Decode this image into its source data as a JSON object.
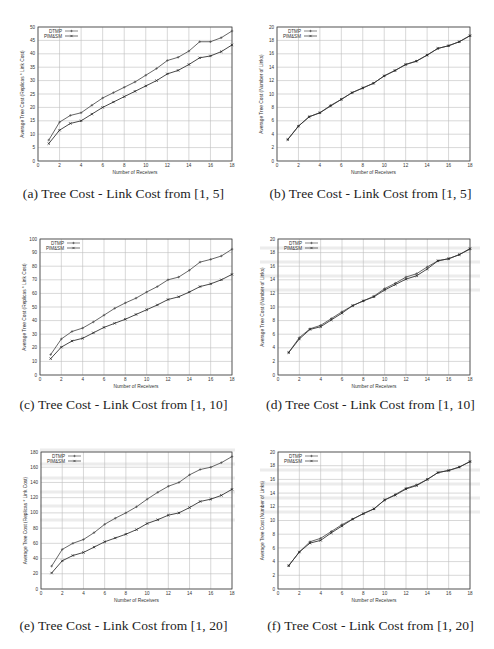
{
  "figure": {
    "captions": {
      "a": "(a) Tree Cost - Link Cost from [1, 5]",
      "b": "(b) Tree Cost - Link Cost from [1, 5]",
      "c": "(c) Tree Cost - Link Cost from [1, 10]",
      "d": "(d) Tree Cost - Link Cost from [1, 10]",
      "e": "(e) Tree Cost - Link Cost from [1, 20]",
      "f": "(f) Tree Cost - Link Cost from [1, 20]"
    }
  },
  "chart_data": [
    {
      "id": "a",
      "type": "line",
      "title": "(a) Tree Cost - Link Cost from [1, 5]",
      "xlabel": "Number of Receivers",
      "ylabel": "Average Tree Cost (Replicas * Link Cost)",
      "xlim": [
        0,
        18
      ],
      "ylim": [
        0,
        50
      ],
      "xticks": [
        0,
        2,
        4,
        6,
        8,
        10,
        12,
        14,
        16,
        18
      ],
      "yticks": [
        0,
        5,
        10,
        15,
        20,
        25,
        30,
        35,
        40,
        45,
        50
      ],
      "grid": true,
      "legend_position": "top-left",
      "x": [
        1,
        2,
        3,
        4,
        5,
        6,
        7,
        8,
        9,
        10,
        11,
        12,
        13,
        14,
        15,
        16,
        17,
        18
      ],
      "series": [
        {
          "name": "DTMP",
          "marker": "+",
          "values": [
            7.8,
            14.5,
            17,
            18,
            20.8,
            23.5,
            25.5,
            27.5,
            29.5,
            32,
            34.5,
            37.5,
            38.7,
            41,
            44.5,
            44.5,
            46,
            48.5
          ]
        },
        {
          "name": "PIM&SM",
          "marker": "x",
          "values": [
            6.5,
            11.5,
            14,
            15,
            17.5,
            20,
            22,
            24,
            26,
            28,
            30,
            32.5,
            33.8,
            36,
            38.5,
            39.2,
            40.8,
            43.3
          ]
        }
      ]
    },
    {
      "id": "b",
      "type": "line",
      "title": "(b) Tree Cost - Link Cost from [1, 5]",
      "xlabel": "Number of Receivers",
      "ylabel": "Average Tree Cost (Number of Links)",
      "xlim": [
        0,
        18
      ],
      "ylim": [
        0,
        20
      ],
      "xticks": [
        0,
        2,
        4,
        6,
        8,
        10,
        12,
        14,
        16,
        18
      ],
      "yticks": [
        0,
        2,
        4,
        6,
        8,
        10,
        12,
        14,
        16,
        18,
        20
      ],
      "grid": true,
      "legend_position": "top-left",
      "x": [
        1,
        2,
        3,
        4,
        5,
        6,
        7,
        8,
        9,
        10,
        11,
        12,
        13,
        14,
        15,
        16,
        17,
        18
      ],
      "series": [
        {
          "name": "DTMP",
          "marker": "+",
          "values": [
            3.2,
            5.2,
            6.6,
            7.2,
            8.3,
            9.2,
            10.2,
            10.9,
            11.6,
            12.7,
            13.5,
            14.4,
            14.9,
            15.8,
            16.8,
            17.2,
            17.8,
            18.7
          ]
        },
        {
          "name": "PIM&SM",
          "marker": "x",
          "values": [
            3.2,
            5.2,
            6.6,
            7.2,
            8.2,
            9.2,
            10.2,
            10.9,
            11.6,
            12.7,
            13.5,
            14.4,
            14.9,
            15.8,
            16.8,
            17.2,
            17.8,
            18.7
          ]
        }
      ]
    },
    {
      "id": "c",
      "type": "line",
      "title": "(c) Tree Cost - Link Cost from [1, 10]",
      "xlabel": "Number of Receivers",
      "ylabel": "Average Tree Cost (Replicas * Link Cost)",
      "xlim": [
        0,
        18
      ],
      "ylim": [
        0,
        100
      ],
      "xticks": [
        0,
        2,
        4,
        6,
        8,
        10,
        12,
        14,
        16,
        18
      ],
      "yticks": [
        0,
        10,
        20,
        30,
        40,
        50,
        60,
        70,
        80,
        90,
        100
      ],
      "grid": true,
      "legend_position": "top-left",
      "x": [
        1,
        2,
        3,
        4,
        5,
        6,
        7,
        8,
        9,
        10,
        11,
        12,
        13,
        14,
        15,
        16,
        17,
        18
      ],
      "series": [
        {
          "name": "DTMP",
          "marker": "+",
          "values": [
            15,
            26.5,
            32,
            34.5,
            39,
            44,
            49,
            53,
            56.5,
            61,
            65,
            70,
            72,
            77,
            83,
            85,
            87.5,
            92.5
          ]
        },
        {
          "name": "PIM&SM",
          "marker": "x",
          "values": [
            12,
            20.5,
            25,
            27,
            31,
            35,
            38,
            41,
            44.5,
            48,
            51.5,
            55.5,
            57.5,
            61,
            65,
            67,
            70,
            74
          ]
        }
      ]
    },
    {
      "id": "d",
      "type": "line",
      "title": "(d) Tree Cost - Link Cost from [1, 10]",
      "xlabel": "Number of Receivers",
      "ylabel": "Average Tree Cost (Number of Links)",
      "xlim": [
        0,
        18
      ],
      "ylim": [
        0,
        20
      ],
      "xticks": [
        0,
        2,
        4,
        6,
        8,
        10,
        12,
        14,
        16,
        18
      ],
      "yticks": [
        0,
        2,
        4,
        6,
        8,
        10,
        12,
        14,
        16,
        18,
        20
      ],
      "grid": true,
      "legend_position": "top-left",
      "x": [
        1,
        2,
        3,
        4,
        5,
        6,
        7,
        8,
        9,
        10,
        11,
        12,
        13,
        14,
        15,
        16,
        17,
        18
      ],
      "series": [
        {
          "name": "DTMP",
          "marker": "+",
          "values": [
            3.3,
            5.5,
            6.8,
            7.3,
            8.3,
            9.3,
            10.2,
            10.9,
            11.6,
            12.7,
            13.5,
            14.4,
            14.9,
            15.9,
            16.8,
            17.1,
            17.7,
            18.5
          ]
        },
        {
          "name": "PIM&SM",
          "marker": "x",
          "values": [
            3.3,
            5.3,
            6.7,
            7.1,
            8.1,
            9.1,
            10.2,
            10.9,
            11.5,
            12.5,
            13.3,
            14.1,
            14.6,
            15.6,
            16.8,
            17.1,
            17.7,
            18.6
          ]
        }
      ]
    },
    {
      "id": "e",
      "type": "line",
      "title": "(e) Tree Cost - Link Cost from [1, 20]",
      "xlabel": "Number of Receivers",
      "ylabel": "Average Tree Cost (Replicas * Link Cost)",
      "xlim": [
        0,
        18
      ],
      "ylim": [
        0,
        180
      ],
      "xticks": [
        0,
        2,
        4,
        6,
        8,
        10,
        12,
        14,
        16,
        18
      ],
      "yticks": [
        0,
        20,
        40,
        60,
        80,
        100,
        120,
        140,
        160,
        180
      ],
      "grid": true,
      "legend_position": "top-left",
      "x": [
        1,
        2,
        3,
        4,
        5,
        6,
        7,
        8,
        9,
        10,
        11,
        12,
        13,
        14,
        15,
        16,
        17,
        18
      ],
      "series": [
        {
          "name": "DTMP",
          "marker": "+",
          "values": [
            30,
            52,
            60,
            65,
            74,
            85,
            93,
            100,
            108,
            118,
            127,
            135,
            140,
            150,
            157,
            160,
            166,
            174
          ]
        },
        {
          "name": "PIM&SM",
          "marker": "x",
          "values": [
            21,
            37,
            44,
            48,
            55,
            62,
            67,
            72,
            78,
            86,
            91,
            97,
            100,
            107,
            115,
            118,
            123,
            131
          ]
        }
      ]
    },
    {
      "id": "f",
      "type": "line",
      "title": "(f) Tree Cost - Link Cost from [1, 20]",
      "xlabel": "Number of Receivers",
      "ylabel": "Average Tree Cost (Number of Links)",
      "xlim": [
        0,
        18
      ],
      "ylim": [
        0,
        20
      ],
      "xticks": [
        0,
        2,
        4,
        6,
        8,
        10,
        12,
        14,
        16,
        18
      ],
      "yticks": [
        0,
        2,
        4,
        6,
        8,
        10,
        12,
        14,
        16,
        18,
        20
      ],
      "grid": true,
      "legend_position": "top-left",
      "x": [
        1,
        2,
        3,
        4,
        5,
        6,
        7,
        8,
        9,
        10,
        11,
        12,
        13,
        14,
        15,
        16,
        17,
        18
      ],
      "series": [
        {
          "name": "DTMP",
          "marker": "+",
          "values": [
            3.4,
            5.4,
            6.9,
            7.4,
            8.4,
            9.4,
            10.2,
            11,
            11.7,
            13,
            13.8,
            14.7,
            15.2,
            16,
            17,
            17.3,
            17.8,
            18.6
          ]
        },
        {
          "name": "PIM&SM",
          "marker": "x",
          "values": [
            3.4,
            5.4,
            6.7,
            7.1,
            8.2,
            9.2,
            10.2,
            11,
            11.7,
            13,
            13.7,
            14.6,
            15.1,
            16,
            17,
            17.3,
            17.8,
            18.6
          ]
        }
      ]
    }
  ]
}
